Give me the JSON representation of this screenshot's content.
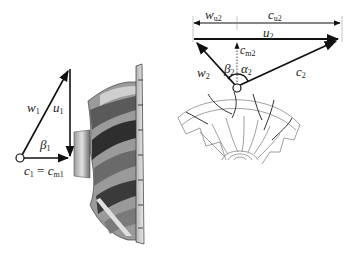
{
  "diagram": {
    "inlet_triangle": {
      "labels": {
        "w1": "w",
        "w1_sub": "1",
        "u1": "u",
        "u1_sub": "1",
        "beta1": "β",
        "beta1_sub": "1",
        "c1": "c",
        "c1_sub": "1",
        "eq": " = ",
        "cm1": "c",
        "cm1_sub": "m1"
      }
    },
    "outlet_triangle": {
      "labels": {
        "wu2": "w",
        "wu2_sub": "u2",
        "cu2": "c",
        "cu2_sub": "u2",
        "u2": "u",
        "u2_sub": "2",
        "cm2": "c",
        "cm2_sub": "m2",
        "w2": "w",
        "w2_sub": "2",
        "beta2": "β",
        "beta2_sub": "2",
        "alpha2": "α",
        "alpha2_sub": "2",
        "c2": "c",
        "c2_sub": "2"
      }
    },
    "colors": {
      "line": "#111111",
      "impeller_dark": "#2b2b2b",
      "impeller_mid": "#8a8a8a",
      "impeller_light": "#d8d8d8",
      "sketch": "#777777"
    }
  }
}
